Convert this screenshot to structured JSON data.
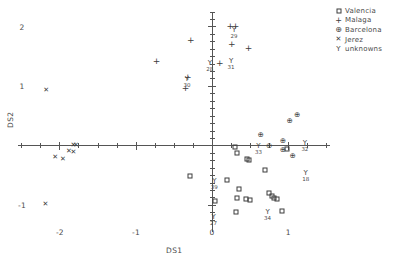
{
  "chart_data": {
    "type": "scatter",
    "title": "",
    "xlabel": "DS1",
    "ylabel": "DS2",
    "xlim": [
      -2.55,
      1.55
    ],
    "ylim": [
      -1.45,
      2.25
    ],
    "xticks": [
      -2,
      -1,
      0,
      1
    ],
    "xtick_labels": [
      "-2",
      "-1",
      "0",
      "1"
    ],
    "yticks": [
      2,
      1,
      -1
    ],
    "ytick_labels": [
      "2",
      "1",
      "-1"
    ],
    "grid": false,
    "axes_style": "crosshair-through-origin",
    "legend_position": "top-right",
    "series": [
      {
        "name": "Valencia",
        "marker": "square",
        "glyph": "□",
        "points": [
          {
            "x": 0.3,
            "y": -0.02
          },
          {
            "x": 0.33,
            "y": -0.12
          },
          {
            "x": 0.46,
            "y": -0.22
          },
          {
            "x": 0.49,
            "y": -0.24
          },
          {
            "x": 0.99,
            "y": -0.05
          },
          {
            "x": 0.7,
            "y": -0.4
          },
          {
            "x": -0.29,
            "y": -0.5
          },
          {
            "x": 0.36,
            "y": -0.72
          },
          {
            "x": 0.33,
            "y": -0.88
          },
          {
            "x": 0.44,
            "y": -0.9
          },
          {
            "x": 0.5,
            "y": -0.92
          },
          {
            "x": 0.04,
            "y": -0.93
          },
          {
            "x": 0.75,
            "y": -0.8
          },
          {
            "x": 0.79,
            "y": -0.84
          },
          {
            "x": 0.82,
            "y": -0.88
          },
          {
            "x": 0.85,
            "y": -0.9
          },
          {
            "x": 0.31,
            "y": -1.12
          },
          {
            "x": 0.92,
            "y": -1.1
          },
          {
            "x": 0.2,
            "y": -0.57
          }
        ]
      },
      {
        "name": "Malaga",
        "marker": "plus",
        "glyph": "+",
        "points": [
          {
            "x": -0.28,
            "y": 1.78
          },
          {
            "x": 0.24,
            "y": 2.02
          },
          {
            "x": 0.31,
            "y": 2.02
          },
          {
            "x": 0.26,
            "y": 1.72
          },
          {
            "x": 0.48,
            "y": 1.64
          },
          {
            "x": -0.73,
            "y": 1.42
          },
          {
            "x": 0.1,
            "y": 1.4
          },
          {
            "x": -0.32,
            "y": 1.16
          },
          {
            "x": -0.35,
            "y": 0.98
          }
        ]
      },
      {
        "name": "Barcelona",
        "marker": "circle-plus",
        "glyph": "⊕",
        "points": [
          {
            "x": 1.12,
            "y": 0.52
          },
          {
            "x": 1.02,
            "y": 0.42
          },
          {
            "x": 0.64,
            "y": 0.18
          },
          {
            "x": 0.93,
            "y": 0.08
          },
          {
            "x": 0.75,
            "y": 0.0
          },
          {
            "x": 0.93,
            "y": -0.07
          },
          {
            "x": 1.06,
            "y": -0.17
          }
        ]
      },
      {
        "name": "Jerez",
        "marker": "cross",
        "glyph": "✕",
        "points": [
          {
            "x": -2.18,
            "y": 0.93
          },
          {
            "x": -1.82,
            "y": 0.02
          },
          {
            "x": -1.79,
            "y": 0.02
          },
          {
            "x": -1.88,
            "y": -0.08
          },
          {
            "x": -1.82,
            "y": -0.1
          },
          {
            "x": -2.06,
            "y": -0.19
          },
          {
            "x": -1.96,
            "y": -0.22
          },
          {
            "x": -2.19,
            "y": -0.98
          }
        ]
      },
      {
        "name": "unknowns",
        "marker": "y",
        "glyph": "Y",
        "points": [
          {
            "x": 0.29,
            "y": 1.94,
            "label": "29"
          },
          {
            "x": 0.25,
            "y": 1.42,
            "label": "31"
          },
          {
            "x": -0.03,
            "y": 1.4,
            "label": "28"
          },
          {
            "x": -0.33,
            "y": 1.12,
            "label": "30"
          },
          {
            "x": 1.22,
            "y": 0.04,
            "label": "32"
          },
          {
            "x": 0.61,
            "y": -0.01,
            "label": "33"
          },
          {
            "x": 1.23,
            "y": -0.46,
            "label": "18"
          },
          {
            "x": 0.03,
            "y": -0.6,
            "label": "39"
          },
          {
            "x": 0.02,
            "y": -1.2,
            "label": "27"
          },
          {
            "x": 0.73,
            "y": -1.12,
            "label": "34"
          }
        ]
      }
    ],
    "legend_entries": [
      {
        "label": "Valencia",
        "glyph": "□"
      },
      {
        "label": "Malaga",
        "glyph": "+"
      },
      {
        "label": "Barcelona",
        "glyph": "⊕"
      },
      {
        "label": "Jerez",
        "glyph": "✕"
      },
      {
        "label": "unknowns",
        "glyph": "Y"
      }
    ]
  }
}
